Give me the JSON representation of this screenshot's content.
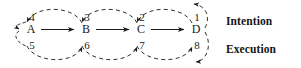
{
  "figure": {
    "background_color": "#ffffff",
    "stroke_color": "#1a1a1a",
    "nodes": [
      {
        "id": "A",
        "label": "A",
        "x": 31,
        "y": 29
      },
      {
        "id": "B",
        "label": "B",
        "x": 86,
        "y": 29
      },
      {
        "id": "C",
        "label": "C",
        "x": 141,
        "y": 29
      },
      {
        "id": "D",
        "label": "D",
        "x": 196,
        "y": 29
      }
    ],
    "solid_arrows": [
      {
        "from": "A",
        "to": "B",
        "direction": "right"
      },
      {
        "from": "B",
        "to": "C",
        "direction": "right"
      },
      {
        "from": "C",
        "to": "D",
        "direction": "right"
      }
    ],
    "intention_arcs": [
      {
        "number": "4",
        "from": "B",
        "to": "A",
        "direction": "left",
        "x": 31,
        "y": 16
      },
      {
        "number": "3",
        "from": "C",
        "to": "B",
        "direction": "left",
        "x": 86,
        "y": 16
      },
      {
        "number": "2",
        "from": "D",
        "to": "C",
        "direction": "left",
        "x": 141,
        "y": 16
      },
      {
        "number": "1",
        "from": "D",
        "to": "D",
        "direction": "left",
        "x": 196,
        "y": 16
      }
    ],
    "execution_arcs": [
      {
        "number": "5",
        "from": "A",
        "to": "B",
        "direction": "right",
        "x": 31,
        "y": 45
      },
      {
        "number": "6",
        "from": "B",
        "to": "C",
        "direction": "right",
        "x": 86,
        "y": 45
      },
      {
        "number": "7",
        "from": "C",
        "to": "D",
        "direction": "right",
        "x": 141,
        "y": 45
      },
      {
        "number": "8",
        "from": "D",
        "to": "D",
        "direction": "right",
        "x": 196,
        "y": 45
      }
    ],
    "row_labels": {
      "intention": "Intention",
      "execution": "Execution"
    }
  }
}
